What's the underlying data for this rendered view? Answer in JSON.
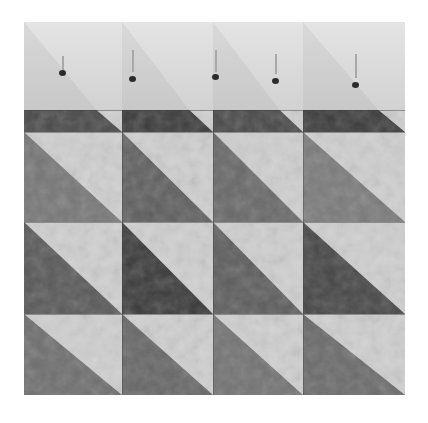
{
  "image": {
    "subject": "quilt-top-half-square-triangle-blocks",
    "background": "#ffffff",
    "colors": {
      "light_fabric": "#cfcfcf",
      "dark_fabric": "#3f3f3f",
      "medium_fabric": "#6f6f6f",
      "top_band": "#dcdcdc",
      "pin_head": "#2b2b2b"
    }
  },
  "quilt": {
    "columns": 4,
    "rows_full": 3,
    "partial_row": "dark-band",
    "pins_count": 5,
    "col_edges": [
      0,
      98,
      189,
      279,
      381
    ],
    "rows": [
      {
        "name": "dark-band",
        "top": 88,
        "height": 22,
        "tones": [
          "#4a4a4a",
          "#3c3c3c",
          "#474747",
          "#3a3a3a"
        ]
      },
      {
        "name": "row-1",
        "top": 110,
        "height": 90,
        "tones": [
          "#767676",
          "#5e5e5e",
          "#686868",
          "#7a7a7a"
        ]
      },
      {
        "name": "row-2",
        "top": 200,
        "height": 92,
        "tones": [
          "#585858",
          "#3a3a3a",
          "#5c5c5c",
          "#454545"
        ]
      },
      {
        "name": "row-3",
        "top": 292,
        "height": 81,
        "tones": [
          "#6e6e6e",
          "#666666",
          "#727272",
          "#6a6a6a"
        ]
      }
    ],
    "pins": [
      {
        "x": 38,
        "top": 34,
        "len": 16,
        "head_y": 48
      },
      {
        "x": 108,
        "top": 28,
        "len": 22,
        "head_y": 54
      },
      {
        "x": 191,
        "top": 28,
        "len": 22,
        "head_y": 52
      },
      {
        "x": 251,
        "top": 32,
        "len": 20,
        "head_y": 56
      },
      {
        "x": 331,
        "top": 32,
        "len": 24,
        "head_y": 60
      }
    ]
  }
}
